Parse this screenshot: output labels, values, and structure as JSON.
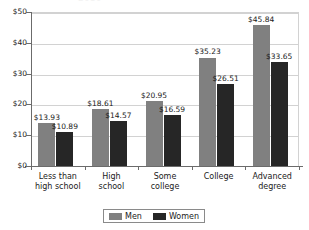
{
  "title_fragment": "2010",
  "chart_data": {
    "type": "bar",
    "title": "",
    "xlabel": "",
    "ylabel": "",
    "ylim": [
      0,
      50
    ],
    "yticks": [
      0,
      10,
      20,
      30,
      40,
      50
    ],
    "ytick_labels": [
      "$0",
      "$10",
      "$20",
      "$30",
      "$40",
      "$50"
    ],
    "grid": true,
    "legend_position": "bottom",
    "categories": [
      "Less than high school",
      "High school",
      "Some college",
      "College",
      "Advanced degree"
    ],
    "category_lines": [
      [
        "Less than",
        "high school"
      ],
      [
        "High",
        "school"
      ],
      [
        "Some",
        "college"
      ],
      [
        "College",
        ""
      ],
      [
        "Advanced",
        "degree"
      ]
    ],
    "series": [
      {
        "name": "Men",
        "color": "#808080",
        "values": [
          13.93,
          18.61,
          20.95,
          35.23,
          45.84
        ],
        "labels": [
          "$13.93",
          "$18.61",
          "$20.95",
          "$35.23",
          "$45.84"
        ]
      },
      {
        "name": "Women",
        "color": "#262626",
        "values": [
          10.89,
          14.57,
          16.59,
          26.51,
          33.65
        ],
        "labels": [
          "$10.89",
          "$14.57",
          "$16.59",
          "$26.51",
          "$33.65"
        ]
      }
    ]
  },
  "legend": {
    "entries": [
      {
        "label": "Men",
        "color": "#808080"
      },
      {
        "label": "Women",
        "color": "#262626"
      }
    ]
  }
}
